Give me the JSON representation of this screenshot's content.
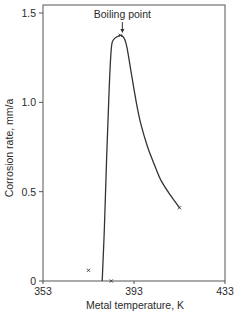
{
  "chart_data": {
    "type": "line",
    "title": "",
    "xlabel": "Metal temperature, K",
    "ylabel": "Corrosion rate, mm/a",
    "xlim": [
      353,
      433
    ],
    "ylim": [
      0,
      1.5
    ],
    "x_ticks": [
      "353",
      "393",
      "433"
    ],
    "y_ticks": [
      "0",
      "0.5",
      "1.0",
      "1.5"
    ],
    "grid": false,
    "legend": null,
    "series": [
      {
        "name": "Corrosion rate curve",
        "x": [
          379,
          380,
          381,
          382,
          383,
          384,
          386,
          387,
          388,
          389,
          390,
          392,
          394,
          396,
          399,
          402,
          405,
          409,
          413
        ],
        "y": [
          0,
          0.3,
          0.7,
          1.05,
          1.3,
          1.35,
          1.37,
          1.375,
          1.37,
          1.35,
          1.3,
          1.15,
          1.0,
          0.88,
          0.75,
          0.65,
          0.56,
          0.48,
          0.41
        ]
      }
    ],
    "markers": [
      {
        "x": 373,
        "y": 0.06
      },
      {
        "x": 383,
        "y": 0.0
      },
      {
        "x": 413,
        "y": 0.41
      },
      {
        "x": 387,
        "y": 1.375
      }
    ],
    "annotations": [
      {
        "text": "Boiling point",
        "x": 387,
        "y": 1.375,
        "arrow": true
      }
    ]
  }
}
